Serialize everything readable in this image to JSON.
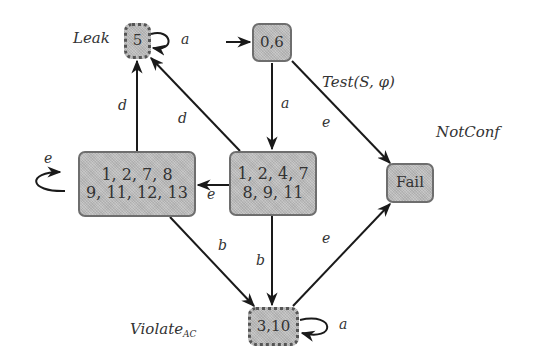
{
  "diagram": {
    "type": "state-machine",
    "nodes": {
      "leak": {
        "id": "5",
        "label": "5",
        "annotation": "Leak",
        "style": "dashed"
      },
      "init": {
        "id": "0,6",
        "label": "0,6",
        "initial": true,
        "style": "solid"
      },
      "left": {
        "id": "1,2,7,8,9,11,12,13",
        "line1": "1, 2, 7, 8",
        "line2": "9, 11, 12, 13",
        "style": "solid"
      },
      "mid": {
        "id": "1,2,4,7,8,9,11",
        "line1": "1, 2, 4, 7",
        "line2": "8, 9, 11",
        "style": "solid"
      },
      "fail": {
        "id": "Fail",
        "label": "Fail",
        "annotation": "NotConf",
        "style": "solid"
      },
      "violate": {
        "id": "3,10",
        "label": "3,10",
        "annotation_main": "Violate",
        "annotation_sub": "AC",
        "style": "dashed"
      }
    },
    "edges": [
      {
        "from": "5",
        "to": "5",
        "label": "a"
      },
      {
        "from": "start",
        "to": "0,6",
        "label": ""
      },
      {
        "from": "0,6",
        "to": "1,2,4,7,8,9,11",
        "label": "a"
      },
      {
        "from": "0,6",
        "to": "Fail",
        "label": "e"
      },
      {
        "from": "1,2,7,8,9,11,12,13",
        "to": "5",
        "label": "d"
      },
      {
        "from": "1,2,4,7,8,9,11",
        "to": "5",
        "label": "d"
      },
      {
        "from": "1,2,4,7,8,9,11",
        "to": "1,2,7,8,9,11,12,13",
        "label": "e"
      },
      {
        "from": "1,2,7,8,9,11,12,13",
        "to": "1,2,7,8,9,11,12,13",
        "label": "e"
      },
      {
        "from": "1,2,7,8,9,11,12,13",
        "to": "3,10",
        "label": "b"
      },
      {
        "from": "1,2,4,7,8,9,11",
        "to": "3,10",
        "label": "b"
      },
      {
        "from": "3,10",
        "to": "Fail",
        "label": "e"
      },
      {
        "from": "3,10",
        "to": "3,10",
        "label": "a"
      }
    ],
    "title_label": "Test(S, φ)",
    "edge_labels": {
      "leak_self": "a",
      "init_to_mid": "a",
      "init_to_fail": "e",
      "left_to_leak": "d",
      "mid_to_leak": "d",
      "mid_to_left": "e",
      "left_self": "e",
      "left_to_violate": "b",
      "mid_to_violate": "b",
      "violate_to_fail": "e",
      "violate_self": "a"
    },
    "colors": {
      "node_fill": "#bdbdbd",
      "node_border": "#6e6e6e",
      "edge": "#1a1a1a",
      "text": "#333333"
    }
  }
}
